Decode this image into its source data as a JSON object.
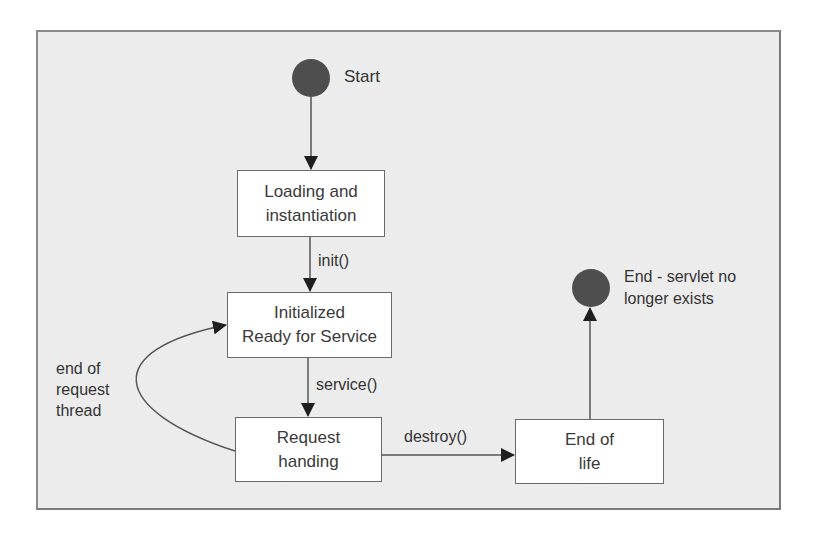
{
  "diagram": {
    "type": "state-diagram",
    "colors": {
      "frame_background": "#ececec",
      "frame_border": "#8a8a8a",
      "node_background": "#ffffff",
      "node_border": "#6a6a6a",
      "terminal_fill": "#4e4e4e",
      "edge": "#555555",
      "text": "#333333"
    },
    "start": {
      "label": "Start"
    },
    "end": {
      "label": "End - servlet no\nlonger exists"
    },
    "nodes": [
      {
        "id": "loading",
        "label": "Loading and\ninstantiation"
      },
      {
        "id": "initialized",
        "label": "Initialized\nReady for Service"
      },
      {
        "id": "request",
        "label": "Request\nhanding"
      },
      {
        "id": "end_of_life",
        "label": "End of\nlife"
      }
    ],
    "edges": [
      {
        "from": "start",
        "to": "loading",
        "label": ""
      },
      {
        "from": "loading",
        "to": "initialized",
        "label": "init()"
      },
      {
        "from": "initialized",
        "to": "request",
        "label": "service()"
      },
      {
        "from": "request",
        "to": "initialized",
        "label": "end of\nrequest\nthread"
      },
      {
        "from": "request",
        "to": "end_of_life",
        "label": "destroy()"
      },
      {
        "from": "end_of_life",
        "to": "end",
        "label": ""
      }
    ]
  }
}
